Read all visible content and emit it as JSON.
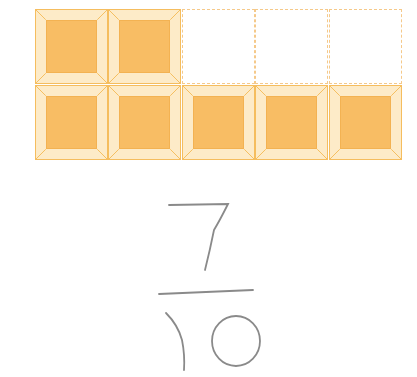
{
  "figure": {
    "grid": {
      "rows": 2,
      "cols": 5,
      "cells": [
        [
          true,
          true,
          false,
          false,
          false
        ],
        [
          true,
          true,
          true,
          true,
          true
        ]
      ],
      "shaded_count": 7,
      "total_count": 10
    },
    "colors": {
      "shaded_fill": "#f8bd64",
      "bevel": "#fdebc8",
      "border": "#f5bd5e",
      "empty_border": "#f5c98a"
    },
    "handwritten_fraction": {
      "numerator": "7",
      "denominator": "10"
    }
  }
}
